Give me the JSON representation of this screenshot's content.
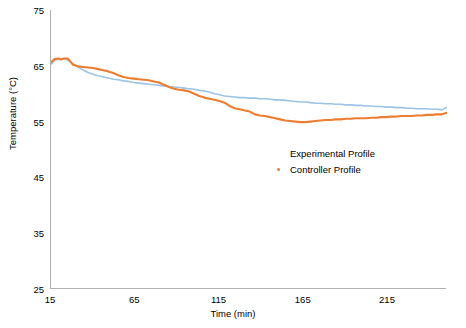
{
  "chart_data": {
    "type": "line",
    "title": "",
    "xlabel": "Time (min)",
    "ylabel": "Temperature (°C)",
    "xlim": [
      15,
      250
    ],
    "ylim": [
      25,
      75
    ],
    "xticks": [
      15,
      65,
      115,
      165,
      215
    ],
    "yticks": [
      25,
      35,
      45,
      55,
      65,
      75
    ],
    "grid": false,
    "legend_position": "center-right-inside",
    "series": [
      {
        "name": "Experimental Profile",
        "color": "#9dc3e6",
        "x": [
          15,
          17,
          19,
          21,
          23,
          25,
          27,
          29,
          31,
          33,
          35,
          37,
          40,
          43,
          46,
          49,
          52,
          55,
          58,
          61,
          64,
          67,
          70,
          73,
          76,
          79,
          82,
          85,
          88,
          91,
          94,
          97,
          100,
          103,
          106,
          109,
          112,
          115,
          118,
          121,
          124,
          127,
          130,
          133,
          136,
          139,
          142,
          145,
          148,
          151,
          154,
          157,
          160,
          163,
          166,
          169,
          172,
          175,
          178,
          181,
          184,
          187,
          190,
          193,
          196,
          199,
          202,
          205,
          208,
          211,
          214,
          217,
          220,
          223,
          226,
          229,
          232,
          235,
          238,
          241,
          244,
          247,
          250
        ],
        "y": [
          65.3,
          65.9,
          66.2,
          66.1,
          66.3,
          66.0,
          65.6,
          65.2,
          64.8,
          64.4,
          64.1,
          63.8,
          63.5,
          63.2,
          63.0,
          62.8,
          62.6,
          62.5,
          62.3,
          62.2,
          62.0,
          61.9,
          61.8,
          61.7,
          61.6,
          61.5,
          61.4,
          61.3,
          61.2,
          61.1,
          61.0,
          60.9,
          60.8,
          60.6,
          60.5,
          60.3,
          60.0,
          59.8,
          59.6,
          59.5,
          59.4,
          59.3,
          59.3,
          59.2,
          59.2,
          59.1,
          59.1,
          59.0,
          58.9,
          58.9,
          58.8,
          58.7,
          58.6,
          58.5,
          58.5,
          58.4,
          58.3,
          58.3,
          58.2,
          58.2,
          58.1,
          58.1,
          58.0,
          58.0,
          57.9,
          57.9,
          57.8,
          57.8,
          57.7,
          57.7,
          57.6,
          57.6,
          57.5,
          57.5,
          57.4,
          57.4,
          57.3,
          57.3,
          57.3,
          57.2,
          57.2,
          57.1,
          57.6
        ]
      },
      {
        "name": "Controller Profile",
        "color": "#ed7d31",
        "x": [
          15,
          17,
          19,
          21,
          23,
          25,
          28,
          31,
          34,
          37,
          40,
          43,
          46,
          49,
          52,
          55,
          58,
          61,
          64,
          67,
          70,
          73,
          76,
          79,
          82,
          85,
          88,
          91,
          94,
          97,
          100,
          103,
          106,
          109,
          112,
          115,
          118,
          121,
          124,
          127,
          130,
          133,
          136,
          139,
          142,
          145,
          148,
          151,
          154,
          157,
          160,
          163,
          166,
          169,
          172,
          175,
          178,
          181,
          184,
          187,
          190,
          193,
          196,
          199,
          202,
          205,
          208,
          211,
          214,
          217,
          220,
          223,
          226,
          229,
          232,
          235,
          238,
          241,
          244,
          247,
          250
        ],
        "y": [
          65.6,
          66.2,
          66.3,
          66.2,
          66.3,
          66.3,
          65.2,
          64.9,
          64.8,
          64.7,
          64.6,
          64.4,
          64.2,
          64.0,
          63.7,
          63.3,
          63.0,
          62.8,
          62.7,
          62.6,
          62.5,
          62.4,
          62.2,
          62.0,
          61.6,
          61.2,
          60.9,
          60.7,
          60.6,
          60.4,
          60.0,
          59.6,
          59.3,
          59.1,
          58.9,
          58.7,
          58.4,
          57.8,
          57.4,
          57.2,
          57.0,
          56.8,
          56.3,
          56.1,
          56.0,
          55.8,
          55.6,
          55.4,
          55.2,
          55.1,
          55.0,
          54.9,
          54.9,
          55.0,
          55.1,
          55.2,
          55.3,
          55.3,
          55.4,
          55.4,
          55.5,
          55.5,
          55.6,
          55.6,
          55.6,
          55.7,
          55.7,
          55.8,
          55.8,
          55.9,
          55.9,
          56.0,
          56.0,
          56.0,
          56.1,
          56.1,
          56.2,
          56.2,
          56.3,
          56.3,
          56.6
        ]
      }
    ]
  },
  "legend": {
    "items": [
      {
        "label": "Experimental Profile",
        "marker": "none"
      },
      {
        "label": "Controller Profile",
        "marker": "dot"
      }
    ]
  }
}
